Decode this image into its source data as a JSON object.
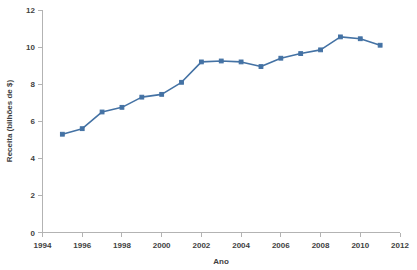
{
  "chart_data": {
    "type": "line",
    "title": "",
    "xlabel": "Ano",
    "ylabel": "Receita (bilhões de $)",
    "x": [
      1995,
      1996,
      1997,
      1998,
      1999,
      2000,
      2001,
      2002,
      2003,
      2004,
      2005,
      2006,
      2007,
      2008,
      2009,
      2010,
      2011
    ],
    "values": [
      5.3,
      5.6,
      6.5,
      6.75,
      7.3,
      7.45,
      8.1,
      9.2,
      9.25,
      9.2,
      8.95,
      9.4,
      9.65,
      9.85,
      10.55,
      10.45,
      10.1
    ],
    "series": [
      {
        "name": "Receita",
        "values": [
          5.3,
          5.6,
          6.5,
          6.75,
          7.3,
          7.45,
          8.1,
          9.2,
          9.25,
          9.2,
          8.95,
          9.4,
          9.65,
          9.85,
          10.55,
          10.45,
          10.1
        ]
      }
    ],
    "xlim": [
      1994,
      2012
    ],
    "ylim": [
      0,
      12
    ],
    "xticks": [
      1994,
      1996,
      1998,
      2000,
      2002,
      2004,
      2006,
      2008,
      2010,
      2012
    ],
    "xtick_labels": [
      "1994",
      "1996",
      "1998",
      "2000",
      "2002",
      "2004",
      "2006",
      "2008",
      "2010",
      "2012"
    ],
    "yticks": [
      0,
      2,
      4,
      6,
      8,
      10,
      12
    ],
    "ytick_labels": [
      "0",
      "2",
      "4",
      "6",
      "8",
      "10",
      "12"
    ],
    "grid": false,
    "legend": false,
    "legend_position": "none",
    "series_color": "#4472a4",
    "axis_color": "#b3b3b3",
    "text_color": "#3f3f3f",
    "background_color": "#ffffff"
  }
}
